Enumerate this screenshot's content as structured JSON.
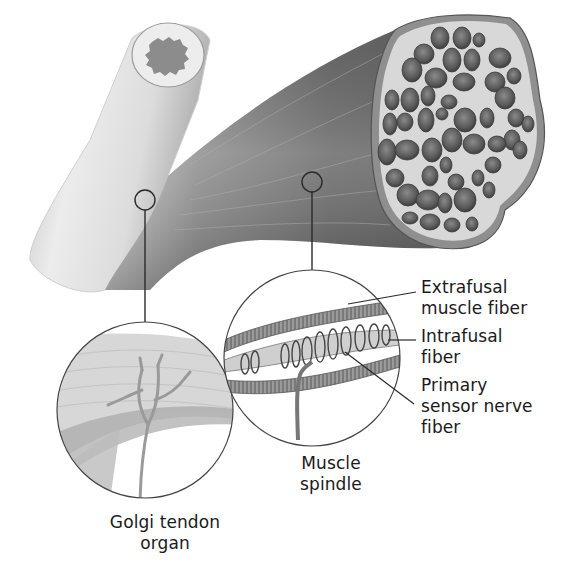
{
  "figure": {
    "colors": {
      "background": "#ffffff",
      "tendon_light": "#e4e4e4",
      "muscle_dark": "#6e6e6e",
      "fascicle_fill": "#5a5a5a",
      "cross_section_bg": "#d6d6d6",
      "outline": "#333333",
      "label_text": "#1a1a1a"
    }
  },
  "labels": {
    "extrafusal": [
      "Extrafusal",
      "muscle fiber"
    ],
    "intrafusal": [
      "Intrafusal",
      "fiber"
    ],
    "primary_sensory": [
      "Primary",
      "sensor nerve",
      "fiber"
    ],
    "muscle_spindle": [
      "Muscle",
      "spindle"
    ],
    "golgi_tendon_organ": [
      "Golgi tendon",
      "organ"
    ]
  },
  "callouts": [
    {
      "name": "golgi-tendon-organ",
      "marker": {
        "x": 145,
        "y": 200,
        "r": 10
      },
      "inset": {
        "x": 145,
        "y": 410,
        "r": 88
      }
    },
    {
      "name": "muscle-spindle",
      "marker": {
        "x": 312,
        "y": 182,
        "r": 10
      },
      "inset": {
        "x": 312,
        "y": 358,
        "r": 88
      }
    }
  ]
}
